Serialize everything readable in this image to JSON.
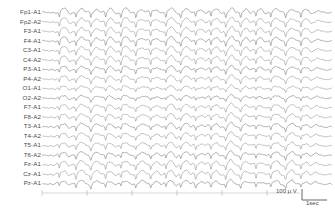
{
  "recording": {
    "title": "EEG recording",
    "montage": "referential",
    "channel_count": 19
  },
  "channels": [
    {
      "label": "Fp1-A1"
    },
    {
      "label": "Fp2-A2"
    },
    {
      "label": "F3-A1"
    },
    {
      "label": "F4-A1"
    },
    {
      "label": "C3-A1"
    },
    {
      "label": "C4-A2"
    },
    {
      "label": "P3-A1"
    },
    {
      "label": "P4-A2"
    },
    {
      "label": "O1-A1"
    },
    {
      "label": "O2-A2"
    },
    {
      "label": "F7-A1"
    },
    {
      "label": "F8-A2"
    },
    {
      "label": "T3-A1"
    },
    {
      "label": "T4-A2"
    },
    {
      "label": "T5-A1"
    },
    {
      "label": "T6-A2"
    },
    {
      "label": "Fz-A1"
    },
    {
      "label": "Cz-A1"
    },
    {
      "label": "Pz-A1"
    }
  ],
  "legend": {
    "amplitude": "100 μ V",
    "time": "1sec",
    "amplitude_value": 100,
    "amplitude_unit": "μV",
    "time_value": 1,
    "time_unit": "sec"
  },
  "colors": {
    "background": "#ffffff",
    "trace": "#6b6b6b",
    "trace_dark": "#4a4a4a",
    "label": "#4a4a4a",
    "axis": "#9a9a9a"
  },
  "chart_data": {
    "type": "line",
    "xlabel": "Time",
    "ylabel": "Channel",
    "grid": false,
    "legend_position": "bottom-right",
    "x_range_seconds": [
      0,
      6.2
    ],
    "sampling_display_px_per_sec": 45,
    "amplitude_scale_uv_per_px": 11.1,
    "series_names": [
      "Fp1-A1",
      "Fp2-A2",
      "F3-A1",
      "F4-A1",
      "C3-A1",
      "C4-A2",
      "P3-A1",
      "P4-A2",
      "O1-A1",
      "O2-A2",
      "F7-A1",
      "F8-A2",
      "T3-A1",
      "T4-A2",
      "T5-A1",
      "T6-A2",
      "Fz-A1",
      "Cz-A1",
      "Pz-A1"
    ],
    "pattern": "generalized spike-and-wave discharges",
    "discharge_frequency_hz": 3.0,
    "discharge_onsets_seconds": [
      0.35,
      0.72,
      1.05,
      1.38,
      1.72,
      2.05,
      2.38,
      2.72,
      3.05,
      3.38,
      3.72,
      4.05,
      4.38,
      4.72,
      5.05,
      5.38,
      5.72
    ]
  }
}
